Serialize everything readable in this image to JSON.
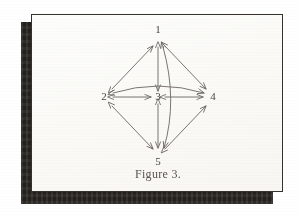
{
  "document": {
    "caption": "Figure 3.",
    "page_background": "#ffffff",
    "paper_color": "#fdfdfb",
    "shadow_color": "#2a2724",
    "ink_color": "#6b6661",
    "label_color": "#4a4643"
  },
  "graph": {
    "title": "Figure 3.",
    "type": "directed-graph",
    "nodes": [
      {
        "id": "1",
        "label": "1",
        "x": 126,
        "y": 23
      },
      {
        "id": "2",
        "label": "2",
        "x": 74,
        "y": 82
      },
      {
        "id": "3",
        "label": "3",
        "x": 126,
        "y": 82
      },
      {
        "id": "4",
        "label": "4",
        "x": 178,
        "y": 82
      },
      {
        "id": "5",
        "label": "5",
        "x": 126,
        "y": 141
      }
    ],
    "edges": [
      {
        "from": "2",
        "to": "1",
        "style": "straight",
        "arrows": "both"
      },
      {
        "from": "1",
        "to": "4",
        "style": "straight",
        "arrows": "both"
      },
      {
        "from": "2",
        "to": "5",
        "style": "straight",
        "arrows": "both"
      },
      {
        "from": "5",
        "to": "4",
        "style": "straight",
        "arrows": "both"
      },
      {
        "from": "2",
        "to": "3",
        "style": "straight",
        "arrows": "both"
      },
      {
        "from": "3",
        "to": "4",
        "style": "straight",
        "arrows": "both"
      },
      {
        "from": "1",
        "to": "3",
        "style": "straight",
        "arrows": "both"
      },
      {
        "from": "3",
        "to": "5",
        "style": "straight",
        "arrows": "both"
      },
      {
        "from": "2",
        "to": "4",
        "style": "curved-above",
        "arrows": "both"
      },
      {
        "from": "1",
        "to": "5",
        "style": "curved-right",
        "arrows": "both"
      }
    ]
  }
}
